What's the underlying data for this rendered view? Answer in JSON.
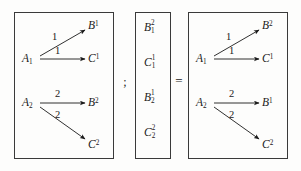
{
  "figure": {
    "separators": {
      "semicolon": ";",
      "equals": "="
    },
    "panels": [
      {
        "id": "left",
        "nodes": [
          {
            "name": "A1",
            "base": "A",
            "sub": "1",
            "sup": ""
          },
          {
            "name": "B1",
            "base": "B",
            "sub": "",
            "sup": "1"
          },
          {
            "name": "C1",
            "base": "C",
            "sub": "",
            "sup": "1"
          },
          {
            "name": "A2",
            "base": "A",
            "sub": "2",
            "sup": ""
          },
          {
            "name": "B2",
            "base": "B",
            "sub": "",
            "sup": "2"
          },
          {
            "name": "C2",
            "base": "C",
            "sub": "",
            "sup": "2"
          }
        ],
        "edges": [
          {
            "from": "A1",
            "to": "B1",
            "label": "1"
          },
          {
            "from": "A1",
            "to": "C1",
            "label": "1"
          },
          {
            "from": "A2",
            "to": "B2",
            "label": "2"
          },
          {
            "from": "A2",
            "to": "C2",
            "label": "2"
          }
        ]
      },
      {
        "id": "middle",
        "vector": [
          {
            "base": "B",
            "sup": "2",
            "sub": "1"
          },
          {
            "base": "C",
            "sup": "1",
            "sub": "1"
          },
          {
            "base": "B",
            "sup": "1",
            "sub": "2"
          },
          {
            "base": "C",
            "sup": "2",
            "sub": "2"
          }
        ]
      },
      {
        "id": "right",
        "nodes": [
          {
            "name": "A1",
            "base": "A",
            "sub": "1",
            "sup": ""
          },
          {
            "name": "B2",
            "base": "B",
            "sub": "",
            "sup": "2"
          },
          {
            "name": "C1",
            "base": "C",
            "sub": "",
            "sup": "1"
          },
          {
            "name": "A2",
            "base": "A",
            "sub": "2",
            "sup": ""
          },
          {
            "name": "B1",
            "base": "B",
            "sub": "",
            "sup": "1"
          },
          {
            "name": "C2",
            "base": "C",
            "sub": "",
            "sup": "2"
          }
        ],
        "edges": [
          {
            "from": "A1",
            "to": "B2",
            "label": "1"
          },
          {
            "from": "A1",
            "to": "C1",
            "label": "1"
          },
          {
            "from": "A2",
            "to": "B1",
            "label": "2"
          },
          {
            "from": "A2",
            "to": "C2",
            "label": "2"
          }
        ]
      }
    ],
    "colors": {
      "ink": "#1a1a1a",
      "border": "#3a3a3a",
      "background": "#fdfdfc"
    }
  }
}
